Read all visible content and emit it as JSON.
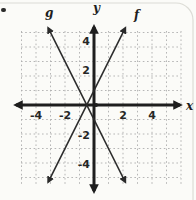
{
  "figure": {
    "kind": "coordinate-plane-graph"
  },
  "chart_data": {
    "type": "line",
    "title": "",
    "xlabel": "x",
    "ylabel": "y",
    "xlim": [
      -5,
      5
    ],
    "ylim": [
      -5,
      5
    ],
    "grid": true,
    "x_tick_values": [
      -4,
      -2,
      2,
      4
    ],
    "x_tick_labels": [
      "-4",
      "-2",
      "2",
      "4"
    ],
    "y_tick_values": [
      4,
      2,
      -2,
      -4
    ],
    "y_tick_labels": [
      "4",
      "2",
      "-2",
      "-4"
    ],
    "series": [
      {
        "name": "f",
        "equation": "f(x) = 2x + 1",
        "slope": 2,
        "y_intercept": 1,
        "points": [
          [
            -3.15,
            -5.3
          ],
          [
            2.15,
            5.3
          ]
        ]
      },
      {
        "name": "g",
        "equation": "g(x) = -2x - 1",
        "slope": -2,
        "y_intercept": -1,
        "points": [
          [
            -3.15,
            5.3
          ],
          [
            2.15,
            -5.3
          ]
        ]
      }
    ],
    "intersection_point": [
      -0.5,
      0
    ],
    "colors": {
      "axis": "#1e1e1e",
      "grid": "#aeaeae",
      "line": "#2a2a2a",
      "text": "#262626",
      "card_border": "#dcdcd6"
    }
  }
}
